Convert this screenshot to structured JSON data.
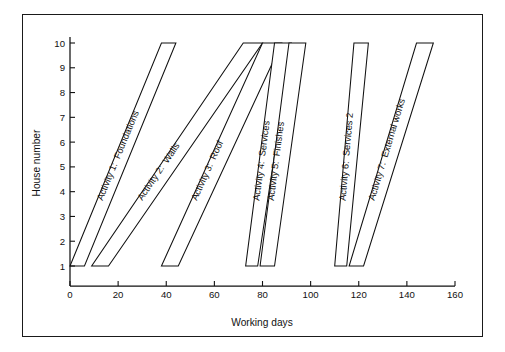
{
  "chart_data": {
    "type": "line",
    "title": "",
    "xlabel": "Working days",
    "ylabel": "House number",
    "xlim": [
      0,
      160
    ],
    "ylim": [
      1,
      10
    ],
    "grid": false,
    "legend_position": "inline-diagonal-labels",
    "x_ticks": [
      0,
      20,
      40,
      60,
      80,
      100,
      120,
      140,
      160
    ],
    "x_tick_labels": [
      "0",
      "20",
      "40",
      "60",
      "80",
      "100",
      "120",
      "140",
      "160"
    ],
    "y_ticks": [
      1,
      2,
      3,
      4,
      5,
      6,
      7,
      8,
      9,
      10
    ],
    "y_tick_labels": [
      "1",
      "2",
      "3",
      "4",
      "5",
      "6",
      "7",
      "8",
      "9",
      "10"
    ],
    "series": [
      {
        "name": "Activity 1: Foundations",
        "label": "Activity 1:  Foundations",
        "start_first_house": 0,
        "finish_first_house": 6,
        "start_last_house": 38,
        "finish_last_house": 44,
        "duration_per_house": 6,
        "first_house": 1,
        "last_house": 10
      },
      {
        "name": "Activity 2: Walls",
        "label": "Activity 2:  Walls",
        "start_first_house": 9,
        "finish_first_house": 16,
        "start_last_house": 72,
        "finish_last_house": 80,
        "duration_per_house": 7,
        "first_house": 1,
        "last_house": 10
      },
      {
        "name": "Activity 3: Roof",
        "label": "Activity 3:  Roof",
        "start_first_house": 38,
        "finish_first_house": 45,
        "start_last_house": 80,
        "finish_last_house": 88,
        "duration_per_house": 7,
        "first_house": 1,
        "last_house": 10
      },
      {
        "name": "Activity 4: Services",
        "label": "Activity 4:  Services",
        "start_first_house": 73,
        "finish_first_house": 78,
        "start_last_house": 85,
        "finish_last_house": 92,
        "duration_per_house": 5,
        "first_house": 1,
        "last_house": 10
      },
      {
        "name": "Activity 5: Finishes",
        "label": "Activity 5:  Finishes",
        "start_first_house": 79,
        "finish_first_house": 85,
        "start_last_house": 91,
        "finish_last_house": 98,
        "duration_per_house": 6,
        "first_house": 1,
        "last_house": 10
      },
      {
        "name": "Activity 6: Services 2",
        "label": "Activity 6:  Services 2",
        "start_first_house": 110,
        "finish_first_house": 115,
        "start_last_house": 118,
        "finish_last_house": 124,
        "duration_per_house": 5,
        "first_house": 1,
        "last_house": 10
      },
      {
        "name": "Activity 7: External works",
        "label": "Activity 7:  External works",
        "label_display": "Activity 7:  External works",
        "start_first_house": 116,
        "finish_first_house": 122,
        "start_last_house": 144,
        "finish_last_house": 151,
        "duration_per_house": 6,
        "first_house": 1,
        "last_house": 10
      }
    ]
  },
  "axes": {
    "x_title": "Working days",
    "y_title": "House number"
  }
}
